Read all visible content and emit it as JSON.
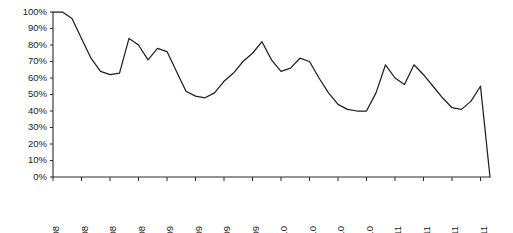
{
  "chart_data": {
    "type": "line",
    "title": "",
    "subtitle": "",
    "xlabel": "",
    "ylabel": "",
    "grid": false,
    "legend": false,
    "ylim": [
      0,
      100
    ],
    "y_unit": "%",
    "ytick_labels": [
      "100%",
      "90%",
      "80%",
      "70%",
      "60%",
      "50%",
      "40%",
      "30%",
      "20%",
      "10%",
      "0%"
    ],
    "ytick_values": [
      100,
      90,
      80,
      70,
      60,
      50,
      40,
      30,
      20,
      10,
      0
    ],
    "xtick_labels": [
      "Mar-08",
      "Jun-08",
      "Sep-08",
      "Dec-08",
      "Mar-09",
      "Jun-09",
      "Sep-09",
      "Dec-09",
      "Mar-10",
      "Jun-10",
      "Sep-10",
      "Dec-10",
      "Mar-11",
      "Jun-11",
      "Sep-11",
      "Dec-11"
    ],
    "xtick_interval_months": 3,
    "x_start": "Mar-08",
    "x_end": "Dec-11",
    "series": [
      {
        "name": "Series 1",
        "color": "#1f1f1f",
        "x": [
          "Mar-08",
          "Apr-08",
          "May-08",
          "Jun-08",
          "Jul-08",
          "Aug-08",
          "Sep-08",
          "Oct-08",
          "Nov-08",
          "Dec-08",
          "Jan-09",
          "Feb-09",
          "Mar-09",
          "Apr-09",
          "May-09",
          "Jun-09",
          "Jul-09",
          "Aug-09",
          "Sep-09",
          "Oct-09",
          "Nov-09",
          "Dec-09",
          "Jan-10",
          "Feb-10",
          "Mar-10",
          "Apr-10",
          "May-10",
          "Jun-10",
          "Jul-10",
          "Aug-10",
          "Sep-10",
          "Oct-10",
          "Nov-10",
          "Dec-10",
          "Jan-11",
          "Feb-11",
          "Mar-11",
          "Apr-11",
          "May-11",
          "Jun-11",
          "Jul-11",
          "Aug-11",
          "Sep-11",
          "Oct-11",
          "Nov-11",
          "Dec-11",
          "Dec-11-end"
        ],
        "values": [
          100,
          100,
          96,
          84,
          72,
          64,
          62,
          63,
          84,
          80,
          71,
          78,
          76,
          64,
          52,
          49,
          48,
          51,
          58,
          63,
          70,
          75,
          82,
          71,
          64,
          66,
          72,
          70,
          60,
          51,
          44,
          41,
          40,
          40,
          51,
          68,
          60,
          56,
          68,
          62,
          55,
          48,
          42,
          41,
          46,
          55,
          0
        ]
      }
    ],
    "final_drop": {
      "description": "vertical drop to zero at series end",
      "from": 68,
      "to": 0
    }
  },
  "axis": {
    "y_axis_name": "percent-axis",
    "x_axis_name": "date-axis"
  }
}
